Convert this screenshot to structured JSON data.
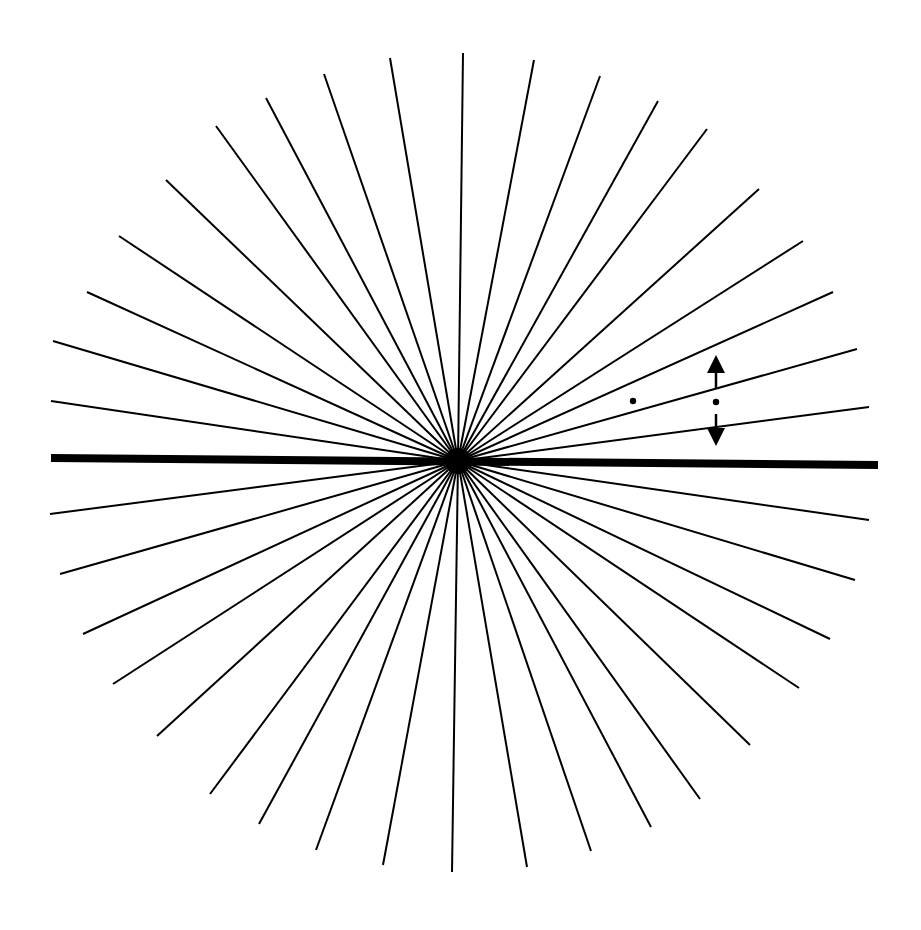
{
  "figure": {
    "background": "#ffffff",
    "ink": "#000000",
    "center": [
      458,
      461
    ],
    "ray_width": 2,
    "rays": [
      [
        463,
        53
      ],
      [
        534,
        60
      ],
      [
        600,
        76
      ],
      [
        658,
        101
      ],
      [
        707,
        129
      ],
      [
        759,
        189
      ],
      [
        803,
        241
      ],
      [
        833,
        292
      ],
      [
        857,
        349
      ],
      [
        869,
        407
      ],
      [
        869,
        520
      ],
      [
        855,
        580
      ],
      [
        830,
        639
      ],
      [
        799,
        688
      ],
      [
        750,
        745
      ],
      [
        700,
        799
      ],
      [
        651,
        827
      ],
      [
        591,
        851
      ],
      [
        527,
        867
      ],
      [
        452,
        872
      ],
      [
        383,
        865
      ],
      [
        316,
        850
      ],
      [
        259,
        824
      ],
      [
        210,
        794
      ],
      [
        157,
        736
      ],
      [
        113,
        684
      ],
      [
        83,
        634
      ],
      [
        60,
        574
      ],
      [
        50,
        514
      ],
      [
        51,
        401
      ],
      [
        53,
        341
      ],
      [
        87,
        292
      ],
      [
        119,
        236
      ],
      [
        166,
        180
      ],
      [
        216,
        126
      ],
      [
        266,
        98
      ],
      [
        324,
        74
      ],
      [
        390,
        58
      ]
    ],
    "horizontal_bar": {
      "from": [
        51,
        458
      ],
      "to": [
        878,
        465
      ],
      "width": 8
    },
    "dots": [
      {
        "name": "reference-dot-left",
        "cx": 633,
        "cy": 401,
        "r": 3.2
      },
      {
        "name": "reference-dot-right",
        "cx": 716,
        "cy": 402,
        "r": 3.2
      }
    ],
    "arrows": {
      "x": 716,
      "up": {
        "tip_y": 355,
        "base_y": 373,
        "shaft_end_y": 389,
        "half_width": 9
      },
      "down": {
        "tip_y": 446,
        "base_y": 428,
        "shaft_end_y": 414,
        "half_width": 9
      },
      "shaft_width": 2.5
    }
  }
}
